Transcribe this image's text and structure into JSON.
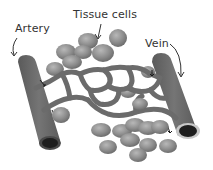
{
  "diagram": {
    "labels": {
      "artery": "Artery",
      "tissue_cells": "Tissue cells",
      "vein": "Vein"
    },
    "colors": {
      "vessel": "#6b6b6b",
      "vessel_dark": "#4a4a4a",
      "lumen": "#1e1e1e",
      "vein_rim": "#c8c8c8",
      "cell": "#8c8c8c",
      "cell_highlight": "#b4b4b4",
      "text": "#333333",
      "background": "#ffffff"
    }
  }
}
